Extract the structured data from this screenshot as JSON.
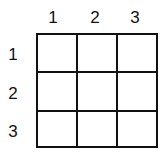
{
  "diagram": {
    "type": "3x3 grid",
    "rows": 3,
    "columns": 3,
    "column_labels": [
      "1",
      "2",
      "3"
    ],
    "row_labels": [
      "1",
      "2",
      "3"
    ],
    "cells": [
      [
        "",
        "",
        ""
      ],
      [
        "",
        "",
        ""
      ],
      [
        "",
        "",
        ""
      ]
    ],
    "line_color": "#111111",
    "background": "#ffffff"
  }
}
